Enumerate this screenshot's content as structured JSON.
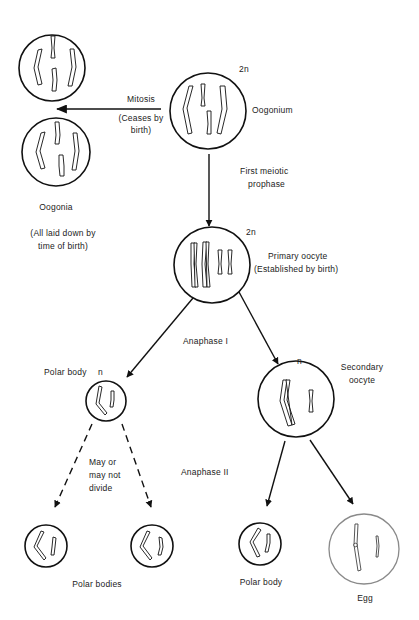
{
  "colors": {
    "line": "#111111",
    "egg_outline": "#8a8a8a",
    "text": "#222222",
    "background": "#ffffff"
  },
  "nodes": {
    "oogonium": {
      "label": "Oogonium",
      "ploidy": "2n"
    },
    "oogonia": {
      "label": "Oogonia",
      "note_line1": "(All laid down by",
      "note_line2": "time of birth)"
    },
    "primary_oocyte": {
      "label_line1": "Primary oocyte",
      "label_line2": "(Established by birth)",
      "ploidy": "2n"
    },
    "first_polar_body": {
      "label": "Polar body",
      "ploidy": "n"
    },
    "secondary_oocyte": {
      "label_line1": "Secondary",
      "label_line2": "oocyte",
      "ploidy": "n"
    },
    "polar_bodies": {
      "label": "Polar bodies"
    },
    "second_polar_body": {
      "label": "Polar body"
    },
    "egg": {
      "label": "Egg"
    }
  },
  "edges": {
    "mitosis": {
      "label_line1": "Mitosis",
      "label_line2": "(Ceases by",
      "label_line3": "birth)"
    },
    "first_meiotic_prophase": {
      "label_line1": "First meiotic",
      "label_line2": "prophase"
    },
    "anaphase_1": {
      "label": "Anaphase I"
    },
    "anaphase_2": {
      "label": "Anaphase II"
    },
    "may_not_divide": {
      "label_line1": "May or",
      "label_line2": "may not",
      "label_line3": "divide"
    }
  }
}
